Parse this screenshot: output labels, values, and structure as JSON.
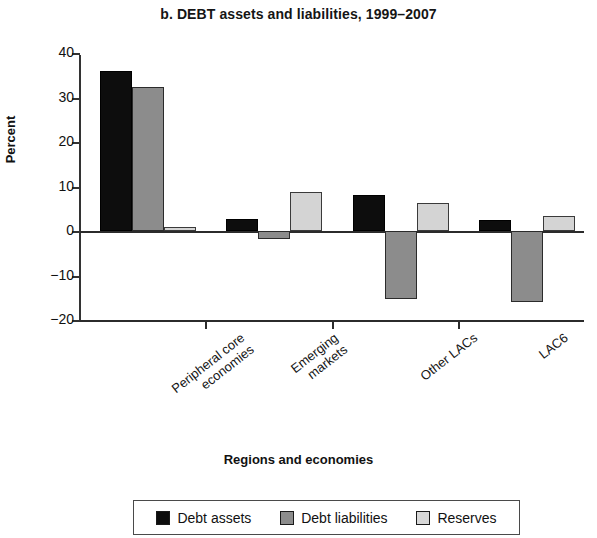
{
  "chart_data": {
    "type": "bar",
    "title": "b. DEBT assets and liabilities, 1999–2007",
    "xlabel": "Regions and economies",
    "ylabel": "Percent",
    "ylim": [
      -20,
      40
    ],
    "yticks": [
      40,
      30,
      20,
      10,
      0,
      -10,
      -20
    ],
    "ytick_labels": [
      "40",
      "30",
      "20",
      "10",
      "0",
      "−10",
      "−20"
    ],
    "grid": false,
    "legend_position": "bottom",
    "categories": [
      "Peripheral core economies",
      "Emerging markets",
      "Other LACs",
      "LAC6"
    ],
    "category_lines": [
      [
        "Peripheral core",
        "economies"
      ],
      [
        "Emerging",
        "markets"
      ],
      [
        "Other LACs"
      ],
      [
        "LAC6"
      ]
    ],
    "series": [
      {
        "name": "Debt assets",
        "color": "#0d0d0d",
        "values": [
          36.0,
          2.8,
          8.0,
          2.4
        ]
      },
      {
        "name": "Debt liabilities",
        "color": "#8c8c8c",
        "values": [
          32.3,
          -1.8,
          -15.3,
          -16.0
        ]
      },
      {
        "name": "Reserves",
        "color": "#d4d4d4",
        "values": [
          1.0,
          8.8,
          6.2,
          3.4
        ]
      }
    ]
  },
  "legend": {
    "items": [
      {
        "label": "Debt assets",
        "swatch": "assets"
      },
      {
        "label": "Debt liabilities",
        "swatch": "liabilities"
      },
      {
        "label": "Reserves",
        "swatch": "reserves"
      }
    ]
  }
}
